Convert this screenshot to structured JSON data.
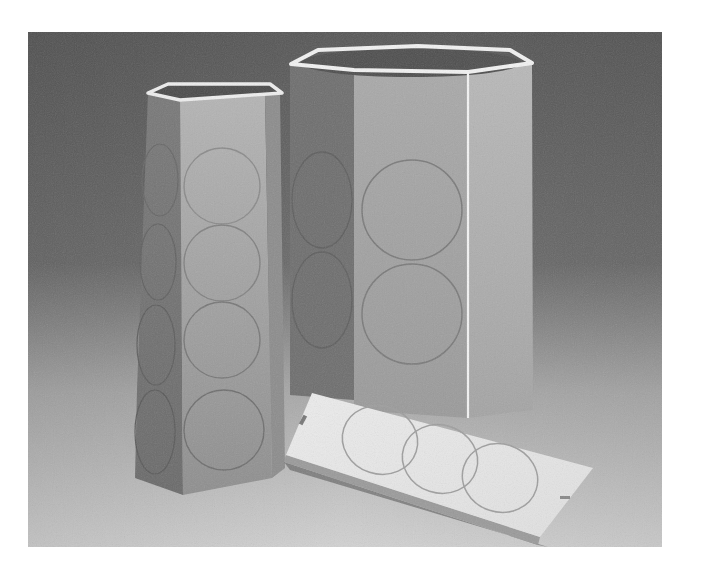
{
  "image": {
    "kind": "grayscale photograph",
    "subject": "three white paper objects with embossed circles on a gradient backdrop",
    "colors": {
      "backdrop_top": "#5a5a5a",
      "backdrop_floor": "#cfcfcf",
      "paper_light": "#e8e8e8",
      "paper_mid": "#a8a8a8",
      "paper_dark": "#6e6e6e"
    },
    "objects": [
      {
        "name": "pentagonal-column",
        "circles": 4
      },
      {
        "name": "hexagonal-column",
        "circles": 2
      },
      {
        "name": "flat-strip",
        "circles": 3
      }
    ]
  }
}
